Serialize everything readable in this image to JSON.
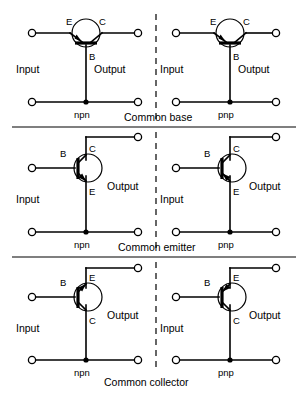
{
  "figure": {
    "ink_color": "#000000",
    "background_color": "#ffffff"
  },
  "labels": {
    "input": "Input",
    "output": "Output",
    "emitter": "E",
    "base": "B",
    "collector": "C",
    "npn": "npn",
    "pnp": "pnp"
  },
  "rows": [
    {
      "caption": "Common base",
      "left": {
        "type": "npn",
        "input_label": "Input",
        "output_label": "Output",
        "terminals": [
          "E",
          "C",
          "B"
        ]
      },
      "right": {
        "type": "pnp",
        "input_label": "Input",
        "output_label": "Output",
        "terminals": [
          "E",
          "C",
          "B"
        ]
      }
    },
    {
      "caption": "Common emitter",
      "left": {
        "type": "npn",
        "input_label": "Input",
        "output_label": "Output",
        "terminals": [
          "B",
          "C",
          "E"
        ]
      },
      "right": {
        "type": "pnp",
        "input_label": "Input",
        "output_label": "Output",
        "terminals": [
          "B",
          "C",
          "E"
        ]
      }
    },
    {
      "caption": "Common collector",
      "left": {
        "type": "npn",
        "input_label": "Input",
        "output_label": "Output",
        "terminals": [
          "B",
          "E",
          "C"
        ]
      },
      "right": {
        "type": "pnp",
        "input_label": "Input",
        "output_label": "Output",
        "terminals": [
          "B",
          "E",
          "C"
        ]
      }
    }
  ]
}
